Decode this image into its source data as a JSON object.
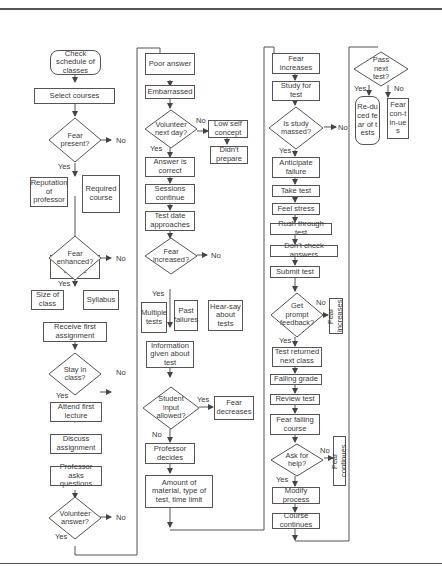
{
  "col1": {
    "start": "Check schedule of classes",
    "select": "Select courses",
    "fear_present": "Fear present?",
    "reputation": "Reputation of professor",
    "required": "Required course",
    "register": "Register for course",
    "fear_enhanced": "Fear enhanced?",
    "size": "Size of class",
    "syllabus": "Syllabus",
    "receive": "Receive first assignment",
    "stay": "Stay in class?",
    "attend": "Attend first lecture",
    "discuss": "Discuss assignment",
    "prof_asks": "Professor asks questions",
    "volunteer": "Volunteer answer?"
  },
  "col2": {
    "poor": "Poor answer",
    "embarrassed": "Embarrassed",
    "volunteer_next": "Volunteer next day?",
    "low_self": "Low self concept",
    "didnt_prepare": "Didn't prepare",
    "correct": "Answer is correct",
    "sessions": "Sessions continue",
    "test_date": "Test date approaches",
    "fear_increased": "Fear increased?",
    "multiple": "Multiple tests",
    "past": "Past failures",
    "hearsay": "Hear-say about tests",
    "info": "Information given about test",
    "student_input": "Student input allowed?",
    "fear_decreases": "Fear decreases",
    "prof_decides": "Professor decides",
    "amount": "Amount of material, type of test, time limit"
  },
  "col3": {
    "fear_increases": "Fear increases",
    "study": "Study for test",
    "massed": "Is study massed?",
    "anticipate": "Anticipate failure",
    "take": "Take test",
    "stress": "Feel stress",
    "rush": "Rush through test",
    "dont_check": "Don't check answers",
    "submit": "Submit test",
    "prompt": "Get prompt feedback?",
    "fear_increases_side": "Fear increases",
    "returned": "Test returned next class",
    "failing": "Failing grade",
    "review": "Review test",
    "fear_failing": "Fear failing course",
    "ask_help": "Ask for help?",
    "fear_continues_side": "Fear continues",
    "modify": "Modify process",
    "course_continues": "Course continues"
  },
  "col4": {
    "pass": "Pass next test?",
    "reduced": "Re-duced fear of tests",
    "fear_cont": "Fear con-tin-ues"
  },
  "labels": {
    "yes": "Yes",
    "no": "No"
  }
}
